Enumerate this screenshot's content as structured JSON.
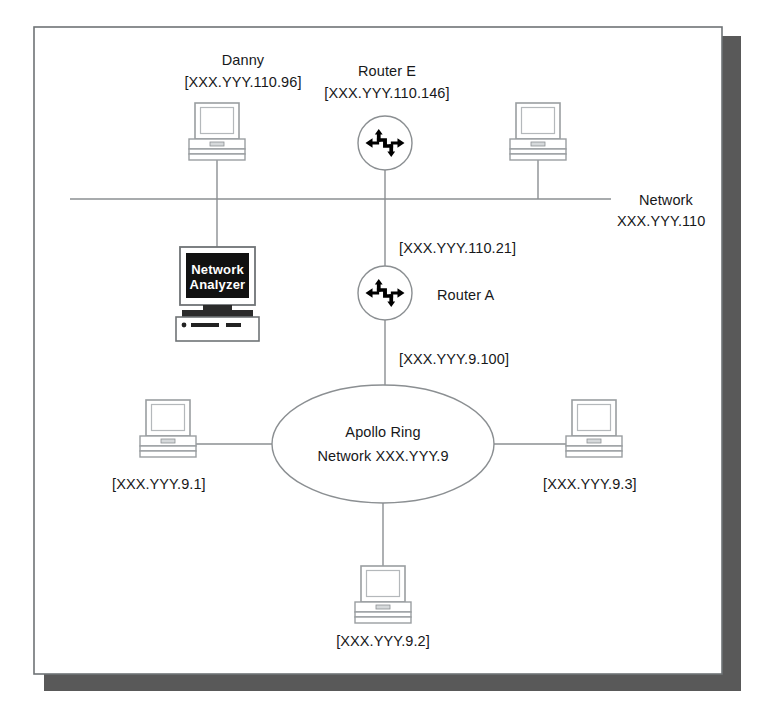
{
  "diagram": {
    "page": {
      "background_color": "#ffffff",
      "border_color": "#6f7376",
      "shadow_color": "#595959"
    },
    "segments": [
      {
        "name": "ethernet-backbone",
        "label_line1": "Network",
        "label_line2": "XXX.YYY.110"
      },
      {
        "name": "apollo-ring",
        "label_line1": "Apollo Ring",
        "label_line2": "Network XXX.YYY.9"
      }
    ],
    "nodes": {
      "danny": {
        "label_line1": "Danny",
        "label_line2": "[XXX.YYY.110.96]",
        "icon": "desktop-computer-icon"
      },
      "router_e": {
        "label_line1": "Router E",
        "label_line2": "[XXX.YYY.110.146]",
        "icon": "router-icon"
      },
      "unlabeled_workstation": {
        "label_line1": "",
        "icon": "desktop-computer-icon"
      },
      "network_analyzer": {
        "screen_line1": "Network",
        "screen_line2": "Analyzer",
        "icon": "network-analyzer-icon"
      },
      "router_a": {
        "label_line1": "Router A",
        "icon": "router-icon"
      },
      "host_9_1": {
        "label_line1": "[XXX.YYY.9.1]",
        "icon": "desktop-computer-icon"
      },
      "host_9_2": {
        "label_line1": "[XXX.YYY.9.2]",
        "icon": "desktop-computer-icon"
      },
      "host_9_3": {
        "label_line1": "[XXX.YYY.9.3]",
        "icon": "desktop-computer-icon"
      }
    },
    "link_labels": {
      "router_a_upper": "[XXX.YYY.110.21]",
      "router_a_lower": "[XXX.YYY.9.100]"
    }
  }
}
